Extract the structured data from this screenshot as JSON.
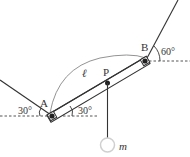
{
  "diagram": {
    "type": "physics-statics",
    "labels": {
      "point_a": "A",
      "point_b": "B",
      "point_p": "P",
      "length": "ℓ",
      "mass": "m",
      "angle_left_string": "30°",
      "angle_bar": "30°",
      "angle_right_string": "60°"
    },
    "colors": {
      "line": "#333333",
      "dash": "#555555",
      "arc": "#666666",
      "mass_fill": "#ffffff",
      "mass_stroke": "#cccccc"
    }
  }
}
